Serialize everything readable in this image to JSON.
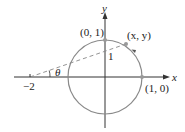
{
  "diagram": {
    "type": "unit-circle-projection",
    "axes": {
      "x_label": "x",
      "y_label": "y"
    },
    "circle": {
      "center": [
        0,
        0
      ],
      "radius": 1,
      "color": "#888888"
    },
    "points": [
      {
        "id": "top",
        "label": "(0, 1)"
      },
      {
        "id": "right",
        "label": "(1, 0)"
      },
      {
        "id": "moving",
        "label": "(x, y)"
      },
      {
        "id": "pole",
        "label": "−2"
      }
    ],
    "segment_label": "1",
    "angle_label": "θ",
    "colors": {
      "axis": "#333333",
      "circle": "#8a8a8a",
      "dash": "#888888",
      "point": "#999999"
    }
  }
}
